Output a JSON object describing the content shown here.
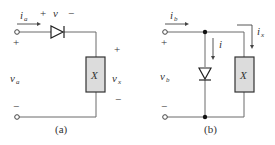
{
  "circuit_a": {
    "caption": "(a)",
    "current_label": "i",
    "current_sub": "a",
    "diode_voltage": {
      "plus": "+",
      "label": "v",
      "minus": "−"
    },
    "source_voltage": {
      "label": "v",
      "sub": "a",
      "plus": "+",
      "minus": "−"
    },
    "load_voltage": {
      "label": "v",
      "sub": "x",
      "plus": "+",
      "minus": "−"
    },
    "element_label": "X"
  },
  "circuit_b": {
    "caption": "(b)",
    "current_label": "i",
    "current_sub": "b",
    "diode_current": "i",
    "load_current": {
      "label": "i",
      "sub": "x"
    },
    "source_voltage": {
      "label": "v",
      "sub": "b",
      "plus": "+",
      "minus": "−"
    },
    "element_label": "X"
  },
  "colors": {
    "wire": "#6b6b6b",
    "element_fill": "#dcdcdc",
    "text": "#333333"
  }
}
